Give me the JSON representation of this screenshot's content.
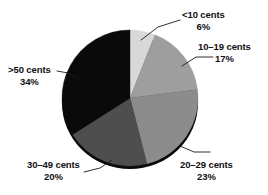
{
  "chart_data": {
    "type": "pie",
    "title": "",
    "subtitle": "",
    "xlabel": "",
    "ylabel": "",
    "legend_position": "callout-labels",
    "grid": false,
    "start_angle_deg": 0,
    "direction": "clockwise",
    "categories": [
      "<10 cents",
      "10–19 cents",
      "20–29 cents",
      "30–49 cents",
      ">50 cents"
    ],
    "values": [
      6,
      17,
      23,
      20,
      34
    ],
    "value_unit": "%",
    "colors": [
      "#d8d8d8",
      "#9e9e9e",
      "#8c8c8c",
      "#4e4e4e",
      "#0a0a0a"
    ],
    "slices": [
      {
        "label": "<10 cents",
        "value": 6,
        "value_text": "6%",
        "color": "#d8d8d8",
        "start_deg": 0.0,
        "end_deg": 21.6
      },
      {
        "label": "10–19 cents",
        "value": 17,
        "value_text": "17%",
        "color": "#9e9e9e",
        "start_deg": 21.6,
        "end_deg": 82.8
      },
      {
        "label": "20–29 cents",
        "value": 23,
        "value_text": "23%",
        "color": "#8c8c8c",
        "start_deg": 82.8,
        "end_deg": 165.6
      },
      {
        "label": "30–49 cents",
        "value": 20,
        "value_text": "20%",
        "color": "#4e4e4e",
        "start_deg": 165.6,
        "end_deg": 237.6
      },
      {
        "label": ">50 cents",
        "value": 34,
        "value_text": "34%",
        "color": "#0a0a0a",
        "start_deg": 237.6,
        "end_deg": 360.0
      }
    ]
  },
  "labels": {
    "lt10": {
      "category": "<10 cents",
      "percent": "6%"
    },
    "t10_19": {
      "category": "10–19 cents",
      "percent": "17%"
    },
    "t20_29": {
      "category": "20–29 cents",
      "percent": "23%"
    },
    "t30_49": {
      "category": "30–49 cents",
      "percent": "20%"
    },
    "gt50": {
      "category": ">50 cents",
      "percent": "34%"
    }
  }
}
